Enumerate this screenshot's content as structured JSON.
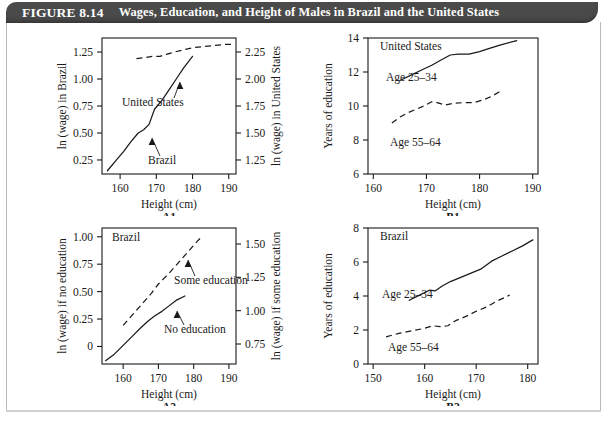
{
  "figure": {
    "number": "FIGURE 8.14",
    "title": "Wages, Education, and Height of Males in Brazil and the United States",
    "banner_color": "#4a4a4a",
    "banner_text_color": "#ffffff",
    "ink_color": "#1a1a1a",
    "background_color": "#ffffff"
  },
  "chart_data": [
    {
      "id": "A1",
      "type": "line",
      "panel_label": "A1",
      "title": "",
      "xlabel": "Height (cm)",
      "ylabel": "ln (wage) in Brazil",
      "ylabel_right": "ln (wage) in United States",
      "xlim": [
        155,
        192
      ],
      "ylim": [
        0.12,
        1.38
      ],
      "ylim_right": [
        1.12,
        2.38
      ],
      "xticks": [
        160,
        170,
        180,
        190
      ],
      "xticklabels": [
        "160",
        "170",
        "180",
        "190"
      ],
      "yticks": [
        0.25,
        0.5,
        0.75,
        1.0,
        1.25
      ],
      "yticklabels": [
        "0.25",
        "0.50",
        "0.75",
        "1.00",
        "1.25"
      ],
      "yticks_right": [
        1.25,
        1.5,
        1.75,
        2.0,
        2.25
      ],
      "yticklabels_right": [
        "1.25",
        "1.50",
        "1.75",
        "2.00",
        "2.25"
      ],
      "grid": false,
      "legend": "inline-annotation",
      "series": [
        {
          "name": "Brazil",
          "style": "solid",
          "axis": "left",
          "label_text": "Brazil",
          "x": [
            156.5,
            159,
            161,
            163,
            165,
            166.5,
            168,
            169.5,
            171.5,
            173.5,
            175.5,
            177.5,
            180
          ],
          "y": [
            0.15,
            0.25,
            0.33,
            0.42,
            0.5,
            0.53,
            0.58,
            0.72,
            0.8,
            0.9,
            1.0,
            1.1,
            1.21
          ]
        },
        {
          "name": "United States",
          "style": "dashed",
          "axis": "right",
          "label_text": "United States",
          "x": [
            164.5,
            167,
            169,
            171,
            173,
            175,
            177.5,
            180,
            183,
            186,
            189,
            191.5
          ],
          "y": [
            2.19,
            2.2,
            2.21,
            2.21,
            2.23,
            2.25,
            2.27,
            2.29,
            2.3,
            2.31,
            2.32,
            2.32
          ]
        }
      ]
    },
    {
      "id": "B1",
      "type": "line",
      "panel_label": "B1",
      "title": "United States",
      "xlabel": "Height (cm)",
      "ylabel": "Years of education",
      "xlim": [
        159,
        191
      ],
      "ylim": [
        6,
        14
      ],
      "xticks": [
        160,
        170,
        180,
        190
      ],
      "xticklabels": [
        "160",
        "170",
        "180",
        "190"
      ],
      "yticks": [
        6,
        8,
        10,
        12,
        14
      ],
      "yticklabels": [
        "6",
        "8",
        "10",
        "12",
        "14"
      ],
      "grid": false,
      "legend": "inline-annotation",
      "series": [
        {
          "name": "Age 25-34",
          "style": "solid",
          "label_text": "Age 25–34",
          "x": [
            165,
            167,
            169,
            171,
            173,
            174.5,
            176,
            178,
            180,
            182,
            184,
            187
          ],
          "y": [
            11.5,
            11.8,
            12.1,
            12.4,
            12.75,
            13.0,
            13.05,
            13.05,
            13.2,
            13.4,
            13.6,
            13.85
          ]
        },
        {
          "name": "Age 55-64",
          "style": "dashed",
          "label_text": "Age 55–64",
          "x": [
            163.5,
            165,
            166.5,
            168,
            169.5,
            171,
            172,
            173.5,
            175,
            177,
            179,
            181,
            182.5,
            184
          ],
          "y": [
            9.0,
            9.35,
            9.6,
            9.8,
            10.0,
            10.25,
            10.2,
            10.05,
            10.15,
            10.2,
            10.2,
            10.4,
            10.6,
            10.9
          ]
        }
      ]
    },
    {
      "id": "A2",
      "type": "line",
      "panel_label": "A2",
      "title": "Brazil",
      "xlabel": "Height (cm)",
      "ylabel": "ln (wage) if no education",
      "ylabel_right": "ln (wage) if some education",
      "xlim": [
        154,
        192
      ],
      "ylim": [
        -0.16,
        1.08
      ],
      "ylim_right": [
        0.6,
        1.62
      ],
      "xticks": [
        160,
        170,
        180,
        190
      ],
      "xticklabels": [
        "160",
        "170",
        "180",
        "190"
      ],
      "yticks": [
        0,
        0.25,
        0.5,
        0.75,
        1.0
      ],
      "yticklabels": [
        "0",
        "0.25",
        "0.50",
        "0.75",
        "1.00"
      ],
      "yticks_right": [
        0.75,
        1.0,
        1.25,
        1.5
      ],
      "yticklabels_right": [
        "0.75",
        "1.00",
        "1.25",
        "1.50"
      ],
      "grid": false,
      "legend": "inline-annotation",
      "series": [
        {
          "name": "No education",
          "style": "solid",
          "axis": "left",
          "label_text": "No education",
          "x": [
            155,
            157.5,
            160,
            162.5,
            165,
            167,
            169,
            171,
            173,
            175,
            177.5
          ],
          "y": [
            -0.13,
            -0.07,
            0.01,
            0.09,
            0.17,
            0.23,
            0.28,
            0.32,
            0.37,
            0.42,
            0.46
          ]
        },
        {
          "name": "Some education",
          "style": "dashed",
          "axis": "right",
          "label_text": "Some education",
          "x": [
            160,
            162,
            164,
            166,
            168,
            170,
            171.5,
            173,
            175,
            177,
            179,
            181,
            182.5
          ],
          "y": [
            0.89,
            0.95,
            1.01,
            1.07,
            1.13,
            1.2,
            1.24,
            1.28,
            1.34,
            1.4,
            1.46,
            1.52,
            1.56
          ]
        }
      ]
    },
    {
      "id": "B2",
      "type": "line",
      "panel_label": "B2",
      "title": "Brazil",
      "xlabel": "Height (cm)",
      "ylabel": "Years of education",
      "xlim": [
        149,
        182
      ],
      "ylim": [
        0,
        8
      ],
      "xticks": [
        150,
        160,
        170,
        180
      ],
      "xticklabels": [
        "150",
        "160",
        "170",
        "180"
      ],
      "yticks": [
        0,
        2,
        4,
        6,
        8
      ],
      "yticklabels": [
        "0",
        "2",
        "4",
        "6",
        "8"
      ],
      "grid": false,
      "legend": "inline-annotation",
      "series": [
        {
          "name": "Age 25-34",
          "style": "solid",
          "label_text": "Age 25–34",
          "x": [
            157,
            159,
            161,
            162,
            163.5,
            165,
            167,
            169,
            171,
            173,
            175,
            177,
            179,
            181
          ],
          "y": [
            3.75,
            4.05,
            4.35,
            4.3,
            4.6,
            4.85,
            5.1,
            5.35,
            5.6,
            6.05,
            6.35,
            6.65,
            6.95,
            7.3
          ]
        },
        {
          "name": "Age 55-64",
          "style": "dashed",
          "label_text": "Age 55–64",
          "x": [
            152.5,
            155,
            157.5,
            160,
            161.5,
            163,
            164.5,
            166,
            168,
            170,
            172,
            174,
            176.5
          ],
          "y": [
            1.6,
            1.8,
            1.95,
            2.1,
            2.25,
            2.2,
            2.25,
            2.55,
            2.8,
            3.1,
            3.35,
            3.7,
            4.05
          ]
        }
      ]
    }
  ]
}
